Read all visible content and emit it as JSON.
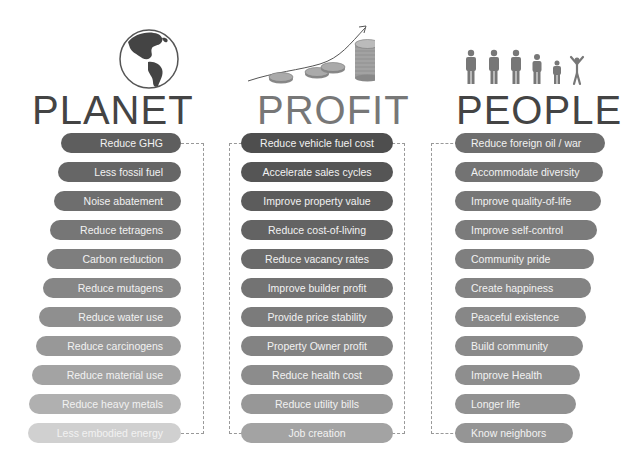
{
  "columns": {
    "planet": {
      "title": "PLANET",
      "icon": "globe-icon",
      "items": [
        {
          "label": "Reduce GHG",
          "color": "#5e5e5e"
        },
        {
          "label": "Less fossil fuel",
          "color": "#666666"
        },
        {
          "label": "Noise abatement",
          "color": "#6e6e6e"
        },
        {
          "label": "Reduce tetragens",
          "color": "#767676"
        },
        {
          "label": "Carbon reduction",
          "color": "#7e7e7e"
        },
        {
          "label": "Reduce mutagens",
          "color": "#868686"
        },
        {
          "label": "Reduce water use",
          "color": "#8f8f8f"
        },
        {
          "label": "Reduce carcinogens",
          "color": "#989898"
        },
        {
          "label": "Reduce material use",
          "color": "#a3a3a3"
        },
        {
          "label": "Reduce heavy metals",
          "color": "#b0b0b0"
        },
        {
          "label": "Less embodied energy",
          "color": "#d0d0d0"
        }
      ]
    },
    "profit": {
      "title": "PROFIT",
      "icon": "coins-growth-chart-icon",
      "items": [
        {
          "label": "Reduce vehicle fuel cost",
          "color": "#4e4e4e"
        },
        {
          "label": "Accelerate sales cycles",
          "color": "#555555"
        },
        {
          "label": "Improve property value",
          "color": "#5c5c5c"
        },
        {
          "label": "Reduce cost-of-living",
          "color": "#636363"
        },
        {
          "label": "Reduce vacancy rates",
          "color": "#6a6a6a"
        },
        {
          "label": "Improve builder profit",
          "color": "#737373"
        },
        {
          "label": "Provide price stability",
          "color": "#7b7b7b"
        },
        {
          "label": "Property Owner profit",
          "color": "#838383"
        },
        {
          "label": "Reduce health cost",
          "color": "#8c8c8c"
        },
        {
          "label": "Reduce utility bills",
          "color": "#979797"
        },
        {
          "label": "Job creation",
          "color": "#a3a3a3"
        }
      ]
    },
    "people": {
      "title": "PEOPLE",
      "icon": "people-figures-icon",
      "items": [
        {
          "label": "Reduce foreign oil / war",
          "color": "#6e6e6e"
        },
        {
          "label": "Accommodate diversity",
          "color": "#737373"
        },
        {
          "label": "Improve quality-of-life",
          "color": "#777777"
        },
        {
          "label": "Improve self-control",
          "color": "#7b7b7b"
        },
        {
          "label": "Community pride",
          "color": "#7f7f7f"
        },
        {
          "label": "Create happiness",
          "color": "#838383"
        },
        {
          "label": "Peaceful existence",
          "color": "#878787"
        },
        {
          "label": "Build community",
          "color": "#8a8a8a"
        },
        {
          "label": "Improve Health",
          "color": "#8e8e8e"
        },
        {
          "label": "Longer life",
          "color": "#919191"
        },
        {
          "label": "Know neighbors",
          "color": "#959595"
        }
      ]
    }
  }
}
